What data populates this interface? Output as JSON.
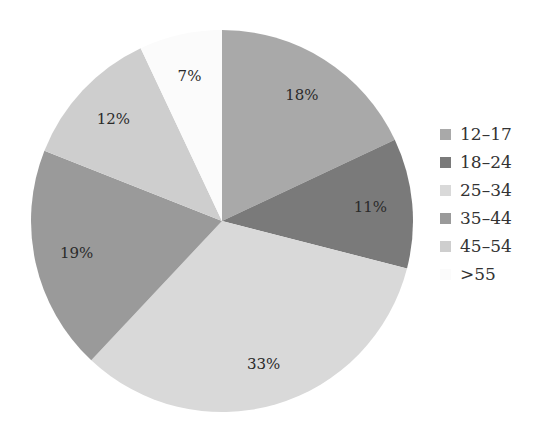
{
  "chart_data": {
    "type": "pie",
    "title": "",
    "categories": [
      "12–17",
      "18–24",
      "25–34",
      "35–44",
      "45–54",
      ">55"
    ],
    "values": [
      18,
      11,
      33,
      19,
      12,
      7
    ],
    "labels": [
      "18%",
      "11%",
      "33%",
      "19%",
      "12%",
      "7%"
    ],
    "colors": [
      "#a9a9a9",
      "#7a7a7a",
      "#d9d9d9",
      "#9a9a9a",
      "#cecece",
      "#fbfbfb"
    ],
    "start_angle": "12 o'clock",
    "direction": "clockwise",
    "legend_position": "right"
  },
  "legend": {
    "items": [
      {
        "label": "12–17"
      },
      {
        "label": "18–24"
      },
      {
        "label": "25–34"
      },
      {
        "label": "35–44"
      },
      {
        "label": "45–54"
      },
      {
        "label": ">55"
      }
    ]
  }
}
